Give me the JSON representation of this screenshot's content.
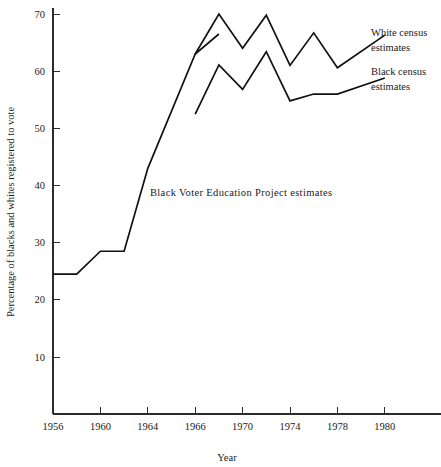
{
  "figure": {
    "background_color": "#ffffff",
    "line_color": "#111111",
    "text_color": "#1a1a1a"
  },
  "chart_data": {
    "type": "line",
    "title": "",
    "subtitle": "",
    "xlabel": "Year",
    "ylabel": "Percentage of blacks and whites registered to vote",
    "grid": false,
    "legend_position": "right-inline-labels",
    "xlim": [
      1956,
      1982
    ],
    "ylim": [
      0,
      72
    ],
    "x_tick_labels": [
      "1956",
      "1960",
      "1964",
      "1966",
      "1970",
      "1974",
      "1978",
      "1980"
    ],
    "x_tick_values": [
      1956,
      1960,
      1964,
      1966,
      1970,
      1974,
      1978,
      1980
    ],
    "y_tick_labels": [
      "10",
      "20",
      "30",
      "40",
      "50",
      "60",
      "70"
    ],
    "y_tick_values": [
      10,
      20,
      30,
      40,
      50,
      60,
      70
    ],
    "annotations": [
      {
        "name": "bvep-annotation",
        "text": "Black Voter Education Project estimates",
        "x_px": 150,
        "y_px": 196
      }
    ],
    "series": [
      {
        "name": "Black Voter Education Project estimates",
        "label": "Black Voter Education Project estimates",
        "label_placement": "inline-annotation",
        "x": [
          1956,
          1958,
          1960,
          1962,
          1964,
          1966,
          1968
        ],
        "values": [
          24.5,
          24.5,
          28.5,
          28.5,
          43.0,
          63.0,
          66.5
        ]
      },
      {
        "name": "White census estimates",
        "label": "White census estimates",
        "label_placement": "right",
        "label_lines": [
          "White census",
          "estimates"
        ],
        "x": [
          1966,
          1968,
          1970,
          1972,
          1974,
          1976,
          1978,
          1980
        ],
        "values": [
          63.0,
          70.0,
          64.0,
          69.8,
          61.0,
          66.7,
          60.6,
          66.3
        ]
      },
      {
        "name": "Black census estimates",
        "label": "Black census estimates",
        "label_placement": "right",
        "label_lines": [
          "Black census",
          "estimates"
        ],
        "x": [
          1966,
          1968,
          1970,
          1972,
          1974,
          1976,
          1978,
          1980
        ],
        "values": [
          52.5,
          61.1,
          56.8,
          63.4,
          54.8,
          56.0,
          56.0,
          58.8
        ]
      }
    ]
  },
  "legend": {
    "white_line1": "White census",
    "white_line2": "estimates",
    "black_line1": "Black census",
    "black_line2": "estimates"
  },
  "axes": {
    "x_title": "Year",
    "y_title": "Percentage of blacks and whites registered to vote"
  }
}
